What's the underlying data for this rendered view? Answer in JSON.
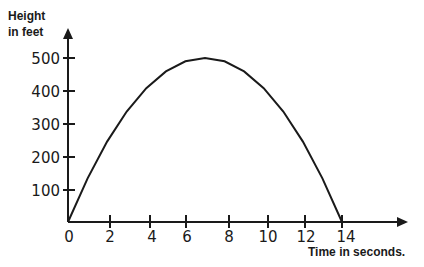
{
  "chart_data": {
    "type": "line",
    "title": "",
    "xlabel": "Time in seconds.",
    "ylabel": "Height in feet",
    "ylabel_lines": [
      "Height",
      "in feet"
    ],
    "x_ticks": [
      "0",
      "2",
      "4",
      "6",
      "8",
      "10",
      "12",
      "14"
    ],
    "y_ticks": [
      "100",
      "200",
      "300",
      "400",
      "500"
    ],
    "xlim": [
      0,
      14
    ],
    "ylim": [
      0,
      500
    ],
    "grid": false,
    "series": [
      {
        "name": "height",
        "x": [
          0,
          1,
          2,
          3,
          4,
          5,
          6,
          7,
          8,
          9,
          10,
          11,
          12,
          13,
          14
        ],
        "values": [
          0,
          133,
          245,
          337,
          408,
          459,
          490,
          500,
          490,
          459,
          408,
          337,
          245,
          133,
          0
        ]
      }
    ],
    "peak": {
      "x": 7,
      "y": 500
    }
  }
}
